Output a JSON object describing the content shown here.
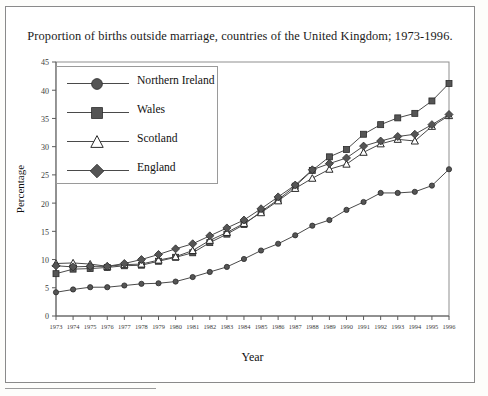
{
  "figure": {
    "title": "Proportion of births outside marriage, countries of the United Kingdom; 1973-1996.",
    "xlabel": "Year",
    "ylabel": "Percentage"
  },
  "legend": {
    "position": "top-left-inside",
    "entries": [
      {
        "label": "Northern Ireland",
        "marker": "filled-circle-icon"
      },
      {
        "label": "Wales",
        "marker": "filled-square-icon"
      },
      {
        "label": "Scotland",
        "marker": "open-triangle-icon"
      },
      {
        "label": "England",
        "marker": "filled-diamond-icon"
      }
    ]
  },
  "axes": {
    "y_ticks": [
      "0",
      "5",
      "10",
      "15",
      "20",
      "25",
      "30",
      "35",
      "40",
      "45"
    ],
    "x_ticks": [
      "1973",
      "1974",
      "1975",
      "1976",
      "1977",
      "1978",
      "1979",
      "1980",
      "1981",
      "1982",
      "1983",
      "1984",
      "1985",
      "1986",
      "1987",
      "1988",
      "1989",
      "1990",
      "1991",
      "1992",
      "1993",
      "1994",
      "1995",
      "1996"
    ]
  },
  "chart_data": {
    "type": "line",
    "title": "Proportion of births outside marriage, countries of the United Kingdom; 1973-1996.",
    "xlabel": "Year",
    "ylabel": "Percentage",
    "xlim": [
      1973,
      1996
    ],
    "ylim": [
      0,
      45
    ],
    "grid": false,
    "legend_position": "top-left-inside",
    "x": [
      1973,
      1974,
      1975,
      1976,
      1977,
      1978,
      1979,
      1980,
      1981,
      1982,
      1983,
      1984,
      1985,
      1986,
      1987,
      1988,
      1989,
      1990,
      1991,
      1992,
      1993,
      1994,
      1995,
      1996
    ],
    "series": [
      {
        "name": "Northern Ireland",
        "marker": "filled-circle",
        "values": [
          4.2,
          4.7,
          5.1,
          5.1,
          5.4,
          5.7,
          5.8,
          6.1,
          6.9,
          7.8,
          8.7,
          10.1,
          11.6,
          12.8,
          14.3,
          16.0,
          17.0,
          18.8,
          20.2,
          21.8,
          21.8,
          22.0,
          23.1,
          26.0
        ]
      },
      {
        "name": "Wales",
        "marker": "filled-square",
        "values": [
          7.5,
          8.3,
          8.4,
          8.6,
          8.9,
          9.0,
          9.7,
          10.4,
          11.2,
          13.0,
          14.5,
          16.2,
          18.5,
          20.6,
          23.0,
          25.8,
          28.2,
          29.5,
          32.2,
          33.9,
          35.1,
          35.9,
          38.1,
          41.2
        ]
      },
      {
        "name": "Scotland",
        "marker": "open-triangle",
        "values": [
          9.3,
          9.4,
          9.2,
          8.8,
          9.1,
          9.2,
          9.9,
          10.5,
          11.6,
          13.4,
          14.8,
          16.4,
          18.3,
          20.4,
          22.6,
          24.4,
          26.0,
          26.9,
          29.0,
          30.5,
          31.3,
          31.0,
          33.6,
          35.5
        ]
      },
      {
        "name": "England",
        "marker": "filled-diamond",
        "values": [
          8.9,
          8.7,
          8.8,
          8.8,
          9.3,
          10.0,
          10.9,
          11.9,
          12.8,
          14.2,
          15.6,
          17.0,
          19.0,
          21.1,
          23.2,
          25.9,
          27.0,
          28.0,
          30.1,
          31.0,
          31.8,
          32.2,
          33.9,
          35.7
        ]
      }
    ]
  }
}
